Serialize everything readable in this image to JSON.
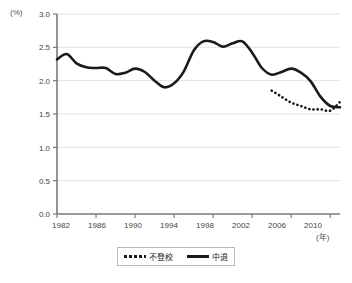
{
  "axes": {
    "y_unit": "(%)",
    "x_unit": "(年)",
    "y_ticks": [
      "3.0",
      "2.5",
      "2.0",
      "1.5",
      "1.0",
      "0.5",
      "0.0"
    ],
    "x_ticks": [
      "1982",
      "1986",
      "1990",
      "1994",
      "1998",
      "2002",
      "2006",
      "2010"
    ]
  },
  "legend": {
    "items": [
      {
        "label": "不登校",
        "style": "dotted",
        "color": "#1a1a1a"
      },
      {
        "label": "中退",
        "style": "solid",
        "color": "#1a1a1a"
      }
    ]
  },
  "colors": {
    "line": "#1a1a1a",
    "gridline": "#e2e2e2",
    "axis": "#7a7a7a",
    "tick_text": "#444444"
  },
  "chart_data": {
    "type": "line",
    "title": "",
    "subtitle": "",
    "xlabel": "(年)",
    "ylabel": "(%)",
    "xlim": [
      1982,
      2011
    ],
    "ylim": [
      0.0,
      3.0
    ],
    "ytick_values": [
      3.0,
      2.5,
      2.0,
      1.5,
      1.0,
      0.5,
      0.0
    ],
    "xtick_values": [
      1982,
      1986,
      1990,
      1994,
      1998,
      2002,
      2006,
      2010
    ],
    "grid": true,
    "legend_position": "bottom-center",
    "x": [
      1982,
      1983,
      1984,
      1985,
      1986,
      1987,
      1988,
      1989,
      1990,
      1991,
      1992,
      1993,
      1994,
      1995,
      1996,
      1997,
      1998,
      1999,
      2000,
      2001,
      2002,
      2003,
      2004,
      2005,
      2006,
      2007,
      2008,
      2009,
      2010,
      2011
    ],
    "series": [
      {
        "name": "中退",
        "style": "solid",
        "values": [
          2.32,
          2.4,
          2.26,
          2.2,
          2.19,
          2.19,
          2.1,
          2.12,
          2.18,
          2.13,
          2.0,
          1.9,
          1.96,
          2.14,
          2.45,
          2.59,
          2.58,
          2.51,
          2.56,
          2.59,
          2.42,
          2.19,
          2.09,
          2.13,
          2.18,
          2.12,
          1.99,
          1.76,
          1.62,
          1.6
        ]
      },
      {
        "name": "不登校",
        "style": "dotted",
        "values": [
          null,
          null,
          null,
          null,
          null,
          null,
          null,
          null,
          null,
          null,
          null,
          null,
          null,
          null,
          null,
          null,
          null,
          null,
          null,
          null,
          null,
          null,
          1.85,
          1.76,
          1.67,
          1.62,
          1.57,
          1.57,
          1.55,
          1.68
        ]
      }
    ]
  }
}
